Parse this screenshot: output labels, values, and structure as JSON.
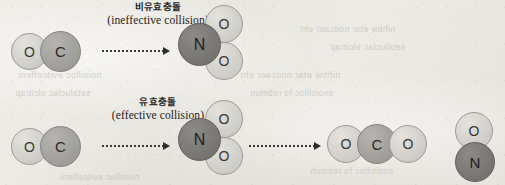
{
  "figure": {
    "kind": "reaction-collision-diagram",
    "background_color": "#ece9e3",
    "paper": "scanned textbook page"
  },
  "rows": [
    {
      "id": "ineffective",
      "title_ko": "비유효충돌",
      "title_en": "(ineffective collision)"
    },
    {
      "id": "effective",
      "title_ko": "유효충돌",
      "title_en": "(effective collision)"
    }
  ],
  "atoms": {
    "oxygen": "O",
    "carbon": "C",
    "nitrogen": "N"
  },
  "colors": {
    "oxygen": "#d6d4cf",
    "carbon": "#a6a4a0",
    "nitrogen": "#7d7b78",
    "outline": "#8d8b86",
    "arrow": "#32302d",
    "text": "#26241f"
  },
  "molecules": {
    "co": {
      "name": "carbon-monoxide",
      "formula": "CO",
      "labels": [
        "O",
        "C"
      ]
    },
    "no2": {
      "name": "nitrogen-dioxide",
      "formula": "NO2",
      "labels": [
        "N",
        "O",
        "O"
      ]
    },
    "co2": {
      "name": "carbon-dioxide",
      "formula": "CO2",
      "labels": [
        "O",
        "C",
        "O"
      ]
    },
    "no": {
      "name": "nitric-oxide",
      "formula": "NO",
      "labels": [
        "O",
        "N"
      ]
    }
  },
  "bleed_through": [
    {
      "text": "noisilloc evitceffeni"
    },
    {
      "text": "nihtiw etar noitcaer eht"
    },
    {
      "text": "setaluclac elcitrap"
    },
    {
      "text": "snoisilloc fo rebmun"
    }
  ]
}
